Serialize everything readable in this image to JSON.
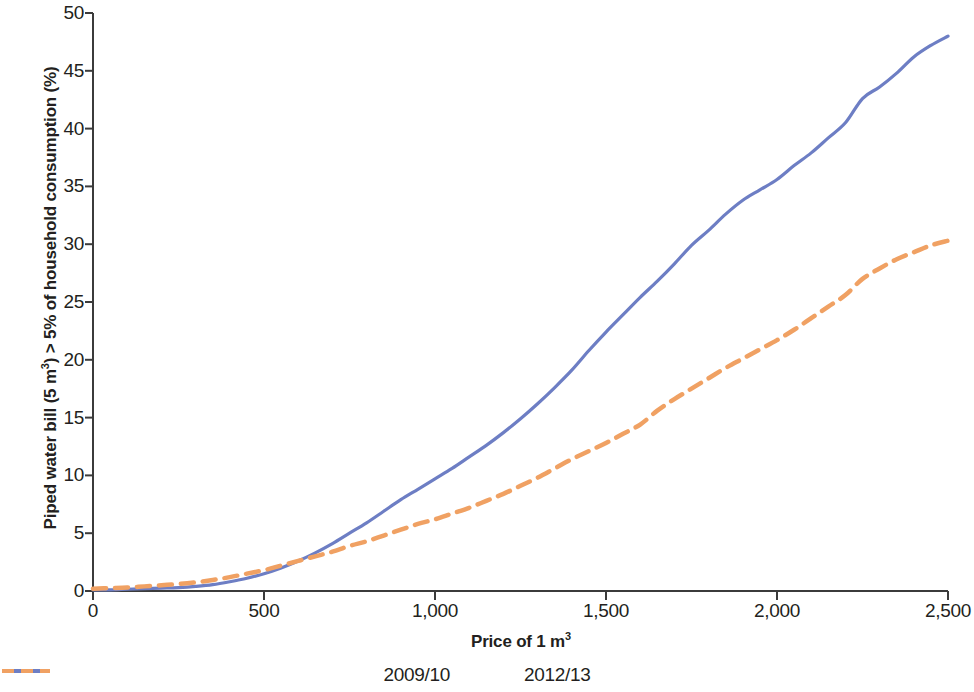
{
  "chart_data": {
    "type": "line",
    "title": "",
    "subtitle": "",
    "xlabel": "Price of 1 m3",
    "xlabel_html": "Price of 1 m<sup>3</sup>",
    "ylabel": "Piped water bill (5 m3) > 5% of household consumption (%)",
    "ylabel_prefix": "Piped water bill (5 m",
    "ylabel_sup": "3",
    "ylabel_suffix": ") > 5% of household consumption (%)",
    "xlim": [
      0,
      2500
    ],
    "ylim": [
      0,
      50
    ],
    "xticks": [
      0,
      500,
      1000,
      1500,
      2000,
      2500
    ],
    "xtick_labels": [
      "0",
      "500",
      "1,000",
      "1,500",
      "2,000",
      "2,500"
    ],
    "yticks": [
      0,
      5,
      10,
      15,
      20,
      25,
      30,
      35,
      40,
      45,
      50
    ],
    "ytick_labels": [
      "0",
      "5",
      "10",
      "15",
      "20",
      "25",
      "30",
      "35",
      "40",
      "45",
      "50"
    ],
    "grid": false,
    "legend_position": "bottom",
    "series": [
      {
        "name": "2009/10",
        "color": "#6d7ec4",
        "style": "solid",
        "x": [
          0,
          50,
          100,
          150,
          200,
          250,
          300,
          350,
          400,
          450,
          500,
          550,
          600,
          650,
          700,
          750,
          800,
          850,
          900,
          950,
          1000,
          1050,
          1100,
          1150,
          1200,
          1250,
          1300,
          1350,
          1400,
          1450,
          1500,
          1550,
          1600,
          1650,
          1700,
          1750,
          1800,
          1850,
          1900,
          1950,
          2000,
          2050,
          2100,
          2150,
          2200,
          2250,
          2300,
          2350,
          2400,
          2450,
          2500
        ],
        "y": [
          0.1,
          0.1,
          0.15,
          0.2,
          0.25,
          0.3,
          0.4,
          0.55,
          0.8,
          1.1,
          1.5,
          2.0,
          2.6,
          3.3,
          4.1,
          5.0,
          5.9,
          6.9,
          7.9,
          8.8,
          9.7,
          10.6,
          11.6,
          12.6,
          13.7,
          14.9,
          16.2,
          17.6,
          19.1,
          20.8,
          22.4,
          23.9,
          25.4,
          26.8,
          28.3,
          29.9,
          31.2,
          32.6,
          33.8,
          34.7,
          35.6,
          36.8,
          37.9,
          39.2,
          40.5,
          42.6,
          43.6,
          44.8,
          46.2,
          47.2,
          48.0
        ]
      },
      {
        "name": "2012/13",
        "color": "#f0a163",
        "style": "dashed",
        "x": [
          0,
          50,
          100,
          150,
          200,
          250,
          300,
          350,
          400,
          450,
          500,
          550,
          600,
          650,
          700,
          750,
          800,
          850,
          900,
          950,
          1000,
          1050,
          1100,
          1150,
          1200,
          1250,
          1300,
          1350,
          1400,
          1450,
          1500,
          1550,
          1600,
          1650,
          1700,
          1750,
          1800,
          1850,
          1900,
          1950,
          2000,
          2050,
          2100,
          2150,
          2200,
          2250,
          2300,
          2350,
          2400,
          2450,
          2500
        ],
        "y": [
          0.2,
          0.25,
          0.3,
          0.4,
          0.5,
          0.6,
          0.75,
          0.95,
          1.2,
          1.5,
          1.8,
          2.2,
          2.6,
          3.0,
          3.4,
          3.9,
          4.3,
          4.8,
          5.3,
          5.8,
          6.2,
          6.7,
          7.2,
          7.8,
          8.4,
          9.1,
          9.8,
          10.6,
          11.4,
          12.1,
          12.8,
          13.6,
          14.4,
          15.6,
          16.6,
          17.5,
          18.4,
          19.3,
          20.1,
          20.9,
          21.7,
          22.6,
          23.6,
          24.6,
          25.6,
          27.0,
          27.9,
          28.7,
          29.3,
          29.9,
          30.3
        ]
      }
    ]
  },
  "legend": {
    "entries": [
      {
        "label": "2009/10",
        "color": "#6d7ec4",
        "style": "solid"
      },
      {
        "label": "2012/13",
        "color": "#f0a163",
        "style": "dashed"
      }
    ]
  },
  "axis": {
    "line_color": "#3b3b3b"
  }
}
